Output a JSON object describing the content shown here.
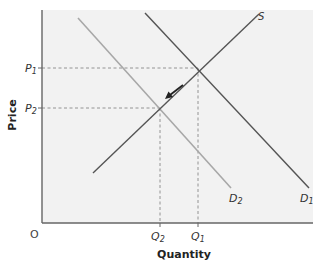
{
  "diagram": {
    "background_color": "#f2f2f2",
    "axes": {
      "x_label": "Quantity",
      "y_label": "Price",
      "origin_label": "O"
    },
    "curves": {
      "supply": {
        "label": "S",
        "color": "#555555"
      },
      "demand1": {
        "label": "D",
        "sub": "1",
        "color": "#555555"
      },
      "demand2": {
        "label": "D",
        "sub": "2",
        "color": "#a8a8a8"
      }
    },
    "prices": [
      {
        "label": "P",
        "sub": "1"
      },
      {
        "label": "P",
        "sub": "2"
      }
    ],
    "quantities": [
      {
        "label": "Q",
        "sub": "2"
      },
      {
        "label": "Q",
        "sub": "1"
      }
    ],
    "shift_arrow": {
      "direction": "down-left along supply curve"
    }
  }
}
